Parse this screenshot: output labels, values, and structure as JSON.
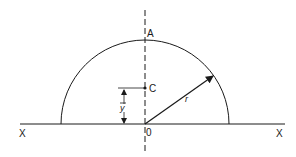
{
  "diagram": {
    "labels": {
      "top_point": "A",
      "centroid": "C",
      "origin": "0",
      "axis_left": "X",
      "axis_right": "X",
      "radius": "r",
      "centroid_height": "y"
    },
    "colors": {
      "stroke": "#1a1a1a",
      "background": "#ffffff"
    }
  }
}
